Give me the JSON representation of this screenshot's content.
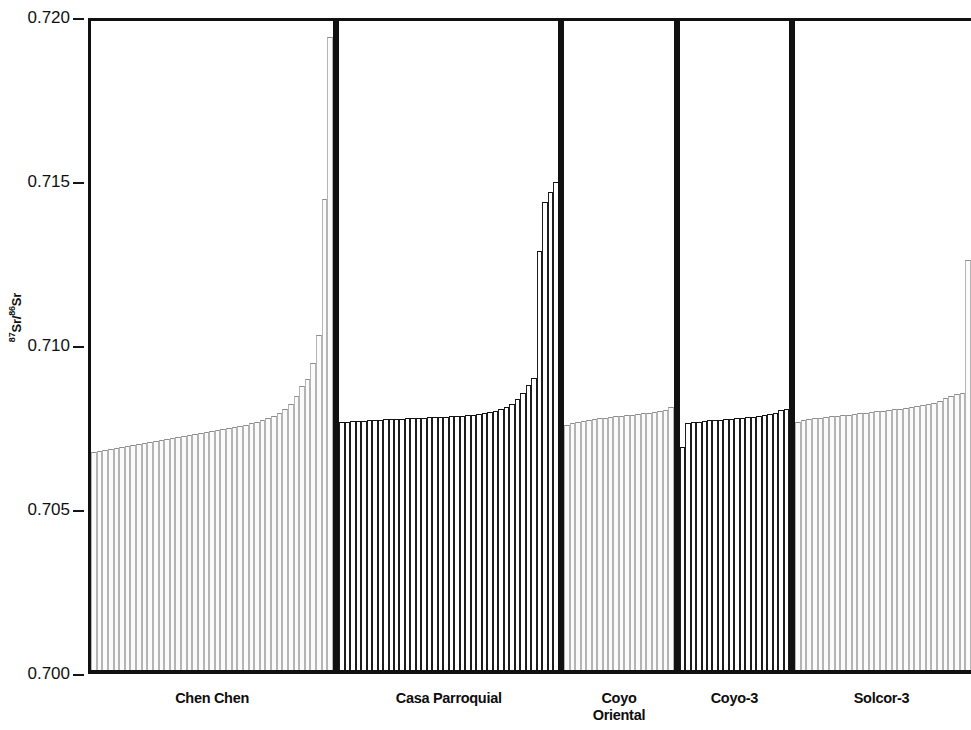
{
  "chart_data": {
    "type": "bar",
    "title": "",
    "xlabel": "",
    "ylabel": "87Sr/86Sr",
    "ylabel_parts": {
      "sup1": "87",
      "mid": "Sr/",
      "sup2": "86",
      "tail": "Sr"
    },
    "ylim": [
      0.7,
      0.72
    ],
    "y_ticks": [
      0.7,
      0.705,
      0.71,
      0.715,
      0.72
    ],
    "y_tick_labels": [
      "0.700",
      "0.705",
      "0.710",
      "0.715",
      "0.720"
    ],
    "grid": false,
    "legend": null,
    "note": "Five site panels of sorted 87Sr/86Sr values, one bar per sample; bars drawn from baseline 0.700.",
    "panels": [
      {
        "name": "Chen Chen",
        "label": "Chen Chen",
        "label_lines": [
          "Chen Chen"
        ],
        "style": "light",
        "n": 43,
        "values": [
          0.70664,
          0.70668,
          0.70671,
          0.70674,
          0.70677,
          0.7068,
          0.70683,
          0.70686,
          0.70689,
          0.70692,
          0.70695,
          0.70698,
          0.70701,
          0.70704,
          0.70707,
          0.7071,
          0.70713,
          0.70716,
          0.70719,
          0.70722,
          0.70725,
          0.70728,
          0.70731,
          0.70734,
          0.70737,
          0.7074,
          0.70744,
          0.70748,
          0.70752,
          0.70757,
          0.70762,
          0.70768,
          0.70775,
          0.70783,
          0.70796,
          0.70812,
          0.70836,
          0.70866,
          0.70888,
          0.70935,
          0.71022,
          0.71437,
          0.7193
        ]
      },
      {
        "name": "Casa Parroquial",
        "label": "Casa Parroquial",
        "label_lines": [
          "Casa Parroquial"
        ],
        "style": "dark",
        "n": 39,
        "values": [
          0.70755,
          0.70757,
          0.70758,
          0.70759,
          0.7076,
          0.70761,
          0.70762,
          0.70763,
          0.70764,
          0.70765,
          0.70766,
          0.70766,
          0.70767,
          0.70768,
          0.70768,
          0.70769,
          0.7077,
          0.7077,
          0.70771,
          0.70772,
          0.70773,
          0.70774,
          0.70775,
          0.70777,
          0.70779,
          0.70781,
          0.70784,
          0.70787,
          0.70791,
          0.70796,
          0.70803,
          0.70812,
          0.70825,
          0.70845,
          0.7087,
          0.7089,
          0.71277,
          0.71427,
          0.71458,
          0.71489
        ]
      },
      {
        "name": "Coyo Oriental",
        "label": "Coyo Oriental",
        "label_lines": [
          "Coyo",
          "Oriental"
        ],
        "style": "light",
        "n": 20,
        "values": [
          0.70748,
          0.70753,
          0.70757,
          0.7076,
          0.70763,
          0.70765,
          0.70767,
          0.70769,
          0.70771,
          0.70773,
          0.70775,
          0.70777,
          0.70779,
          0.70781,
          0.70783,
          0.70785,
          0.70787,
          0.7079,
          0.70793,
          0.70803
        ]
      },
      {
        "name": "Coyo-3",
        "label": "Coyo-3",
        "label_lines": [
          "Coyo-3"
        ],
        "style": "dark",
        "n": 20,
        "values": [
          0.70679,
          0.70752,
          0.70755,
          0.70757,
          0.70759,
          0.70761,
          0.70762,
          0.70763,
          0.70764,
          0.70766,
          0.70767,
          0.70768,
          0.7077,
          0.70771,
          0.70773,
          0.70776,
          0.7078,
          0.70785,
          0.70792,
          0.70797
        ]
      },
      {
        "name": "Solcor-3",
        "label": "Solcor-3",
        "label_lines": [
          "Solcor-3"
        ],
        "style": "light",
        "n": 31,
        "values": [
          0.70757,
          0.70761,
          0.70764,
          0.70767,
          0.70769,
          0.70771,
          0.70773,
          0.70775,
          0.70777,
          0.70779,
          0.70781,
          0.70783,
          0.70785,
          0.70787,
          0.70789,
          0.70791,
          0.70793,
          0.70795,
          0.70797,
          0.708,
          0.70803,
          0.70806,
          0.70809,
          0.70812,
          0.70815,
          0.7082,
          0.70828,
          0.70836,
          0.7084,
          0.70845,
          0.71249
        ]
      }
    ]
  },
  "colors": {
    "axis": "#111111",
    "bar_light_edge": "#b4b4b4",
    "bar_dark_edge": "#1d1d1d",
    "background": "#ffffff",
    "text": "#101010"
  }
}
